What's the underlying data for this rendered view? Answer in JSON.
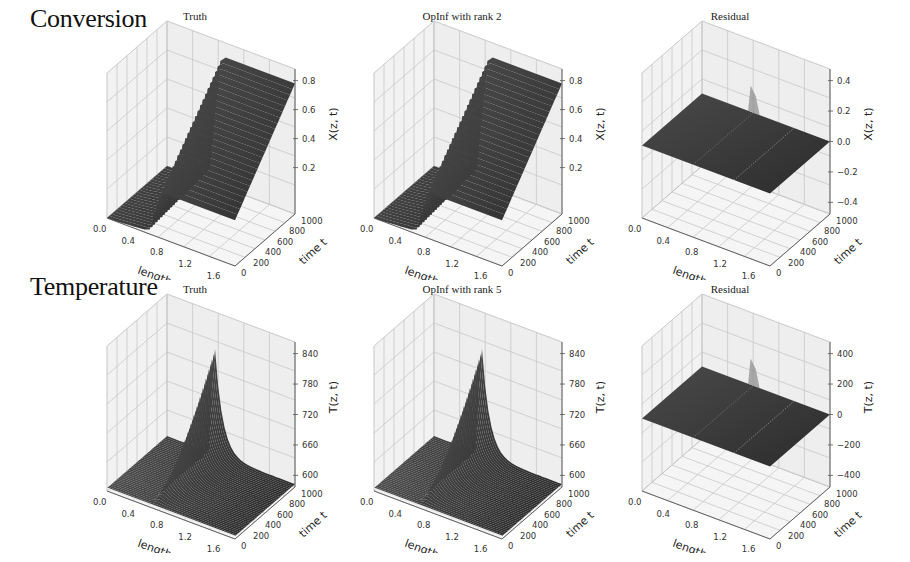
{
  "figure": {
    "rows": [
      {
        "label": "Conversion",
        "panels": [
          {
            "title": "Truth",
            "zlabel": "X(z, t)",
            "zticks": [
              "0.8",
              "0.6",
              "0.4",
              "0.2"
            ],
            "kind": "conv"
          },
          {
            "title": "OpInf with rank 2",
            "zlabel": "X(z, t)",
            "zticks": [
              "0.8",
              "0.6",
              "0.4",
              "0.2"
            ],
            "kind": "conv"
          },
          {
            "title": "Residual",
            "zlabel": "X(z, t)",
            "zticks": [
              "0.4",
              "0.2",
              "0.0",
              "−0.2",
              "−0.4"
            ],
            "kind": "resid"
          }
        ]
      },
      {
        "label": "Temperature",
        "panels": [
          {
            "title": "Truth",
            "zlabel": "T(z, t)",
            "zticks": [
              "840",
              "780",
              "720",
              "660",
              "600"
            ],
            "kind": "temp"
          },
          {
            "title": "OpInf with rank 5",
            "zlabel": "T(z, t)",
            "zticks": [
              "840",
              "780",
              "720",
              "660",
              "600"
            ],
            "kind": "temp"
          },
          {
            "title": "Residual",
            "zlabel": "T(z, t)",
            "zticks": [
              "400",
              "200",
              "0",
              "−200",
              "−400"
            ],
            "kind": "resid"
          }
        ]
      }
    ],
    "xlabel": "length z",
    "ylabel": "time t",
    "xticks": [
      "0.0",
      "0.4",
      "0.8",
      "1.2",
      "1.6"
    ],
    "yticks": [
      "0",
      "200",
      "400",
      "600",
      "800",
      "1000"
    ]
  },
  "colors": {
    "surface": "#3a3a3a",
    "surface_light": "#5a5a5a",
    "pane": "#f2f2f2",
    "grid": "#c8c8c8"
  },
  "chart_data": [
    {
      "type": "surface3d",
      "title": "Truth",
      "row": "Conversion",
      "xlabel": "length z",
      "ylabel": "time t",
      "zlabel": "X(z, t)",
      "xlim": [
        0.0,
        1.8
      ],
      "ylim": [
        0,
        1000
      ],
      "zlim": [
        0.0,
        0.9
      ],
      "xticks": [
        0.0,
        0.4,
        0.8,
        1.2,
        1.6
      ],
      "yticks": [
        0,
        200,
        400,
        600,
        800,
        1000
      ],
      "zticks": [
        0.2,
        0.4,
        0.6,
        0.8
      ],
      "description": "Conversion rises with length z; near z=0 value ~0, steep rise around z~0.6-0.8 to ~0.85 plateau for later times; early times lower."
    },
    {
      "type": "surface3d",
      "title": "OpInf with rank 2",
      "row": "Conversion",
      "xlabel": "length z",
      "ylabel": "time t",
      "zlabel": "X(z, t)",
      "xlim": [
        0.0,
        1.8
      ],
      "ylim": [
        0,
        1000
      ],
      "zlim": [
        0.0,
        0.9
      ],
      "xticks": [
        0.0,
        0.4,
        0.8,
        1.2,
        1.6
      ],
      "yticks": [
        0,
        200,
        400,
        600,
        800,
        1000
      ],
      "zticks": [
        0.2,
        0.4,
        0.6,
        0.8
      ],
      "description": "Visually identical to Truth surface."
    },
    {
      "type": "surface3d",
      "title": "Residual",
      "row": "Conversion",
      "xlabel": "length z",
      "ylabel": "time t",
      "zlabel": "X(z, t)",
      "xlim": [
        0.0,
        1.8
      ],
      "ylim": [
        0,
        1000
      ],
      "zlim": [
        -0.4,
        0.4
      ],
      "xticks": [
        0.0,
        0.4,
        0.8,
        1.2,
        1.6
      ],
      "yticks": [
        0,
        200,
        400,
        600,
        800,
        1000
      ],
      "zticks": [
        -0.4,
        -0.2,
        0.0,
        0.2,
        0.4
      ],
      "description": "Nearly flat at ~0 with a small spike near z~0.8, t~1000."
    },
    {
      "type": "surface3d",
      "title": "Truth",
      "row": "Temperature",
      "xlabel": "length z",
      "ylabel": "time t",
      "zlabel": "T(z, t)",
      "xlim": [
        0.0,
        1.8
      ],
      "ylim": [
        0,
        1000
      ],
      "zlim": [
        570,
        860
      ],
      "xticks": [
        0.0,
        0.4,
        0.8,
        1.2,
        1.6
      ],
      "yticks": [
        0,
        200,
        400,
        600,
        800,
        1000
      ],
      "zticks": [
        600,
        660,
        720,
        780,
        840
      ],
      "description": "Temperature near ~580 everywhere except a sharp ridge rising to ~840 near z~0.6-0.8 at late times (t~1000)."
    },
    {
      "type": "surface3d",
      "title": "OpInf with rank 5",
      "row": "Temperature",
      "xlabel": "length z",
      "ylabel": "time t",
      "zlabel": "T(z, t)",
      "xlim": [
        0.0,
        1.8
      ],
      "ylim": [
        0,
        1000
      ],
      "zlim": [
        570,
        860
      ],
      "xticks": [
        0.0,
        0.4,
        0.8,
        1.2,
        1.6
      ],
      "yticks": [
        0,
        200,
        400,
        600,
        800,
        1000
      ],
      "zticks": [
        600,
        660,
        720,
        780,
        840
      ],
      "description": "Visually identical to Truth surface."
    },
    {
      "type": "surface3d",
      "title": "Residual",
      "row": "Temperature",
      "xlabel": "length z",
      "ylabel": "time t",
      "zlabel": "T(z, t)",
      "xlim": [
        0.0,
        1.8
      ],
      "ylim": [
        0,
        1000
      ],
      "zlim": [
        -400,
        400
      ],
      "xticks": [
        0.0,
        0.4,
        0.8,
        1.2,
        1.6
      ],
      "yticks": [
        0,
        200,
        400,
        600,
        800,
        1000
      ],
      "zticks": [
        -400,
        -200,
        0,
        200,
        400
      ],
      "description": "Nearly flat at ~0 with a small spike near z~0.8, t~1000."
    }
  ]
}
